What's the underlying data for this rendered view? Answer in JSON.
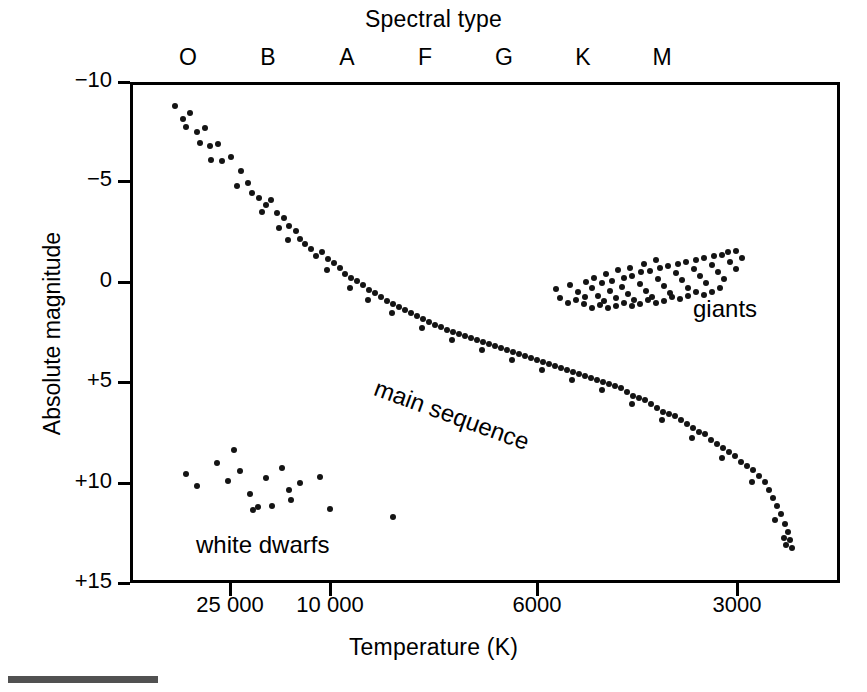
{
  "figure": {
    "top_title": "Spectral type",
    "bottom_title": "Temperature (K)",
    "y_axis_title": "Absolute magnitude"
  },
  "annotations": {
    "main_sequence": "main sequence",
    "giants": "giants",
    "white_dwarfs": "white dwarfs"
  },
  "chart_data": {
    "type": "scatter",
    "xlabel": "Temperature (K)",
    "ylabel": "Absolute magnitude",
    "secondary_xlabel": "Spectral type",
    "grid": false,
    "legend": "none",
    "x_axis": {
      "inverted": true,
      "scale": "log-like (temperature decreasing to the right)",
      "tick_values": [
        25000,
        10000,
        6000,
        3000
      ],
      "tick_labels": [
        "25 000",
        "10 000",
        "6000",
        "3000"
      ],
      "tick_px": [
        230,
        330,
        537,
        737
      ]
    },
    "spectral_axis": {
      "tick_labels": [
        "O",
        "B",
        "A",
        "F",
        "G",
        "K",
        "M"
      ],
      "tick_px": [
        188,
        268,
        347,
        425,
        504,
        583,
        662
      ]
    },
    "y_axis": {
      "inverted": true,
      "tick_values": [
        -10,
        -5,
        0,
        5,
        10,
        15
      ],
      "tick_labels": [
        "−10",
        "−5",
        "0",
        "+5",
        "+10",
        "+15"
      ],
      "tick_px": [
        82,
        181,
        282,
        382,
        483,
        583
      ],
      "ylim": [
        -10,
        15
      ]
    },
    "plot_box_px": {
      "left": 130,
      "top": 82,
      "right": 840,
      "bottom": 583
    },
    "series": [
      {
        "name": "main sequence",
        "point_count": 128,
        "points_px": [
          [
            175,
            106
          ],
          [
            183,
            119
          ],
          [
            190,
            113
          ],
          [
            197,
            132
          ],
          [
            186,
            127
          ],
          [
            205,
            128
          ],
          [
            200,
            143
          ],
          [
            210,
            146
          ],
          [
            218,
            144
          ],
          [
            211,
            160
          ],
          [
            222,
            161
          ],
          [
            231,
            157
          ],
          [
            241,
            171
          ],
          [
            237,
            186
          ],
          [
            248,
            183
          ],
          [
            252,
            193
          ],
          [
            259,
            198
          ],
          [
            266,
            205
          ],
          [
            271,
            200
          ],
          [
            262,
            212
          ],
          [
            277,
            213
          ],
          [
            284,
            218
          ],
          [
            279,
            228
          ],
          [
            289,
            226
          ],
          [
            296,
            231
          ],
          [
            288,
            240
          ],
          [
            300,
            239
          ],
          [
            305,
            244
          ],
          [
            311,
            249
          ],
          [
            316,
            256
          ],
          [
            322,
            252
          ],
          [
            328,
            259
          ],
          [
            334,
            263
          ],
          [
            327,
            270
          ],
          [
            340,
            268
          ],
          [
            345,
            274
          ],
          [
            351,
            278
          ],
          [
            357,
            281
          ],
          [
            350,
            288
          ],
          [
            363,
            285
          ],
          [
            369,
            290
          ],
          [
            375,
            293
          ],
          [
            368,
            300
          ],
          [
            381,
            297
          ],
          [
            387,
            301
          ],
          [
            393,
            304
          ],
          [
            399,
            307
          ],
          [
            392,
            313
          ],
          [
            405,
            310
          ],
          [
            411,
            313
          ],
          [
            417,
            316
          ],
          [
            423,
            319
          ],
          [
            429,
            322
          ],
          [
            422,
            328
          ],
          [
            435,
            325
          ],
          [
            441,
            327
          ],
          [
            447,
            330
          ],
          [
            453,
            332
          ],
          [
            459,
            334
          ],
          [
            452,
            340
          ],
          [
            465,
            336
          ],
          [
            471,
            338
          ],
          [
            477,
            340
          ],
          [
            483,
            342
          ],
          [
            489,
            344
          ],
          [
            482,
            350
          ],
          [
            495,
            346
          ],
          [
            501,
            348
          ],
          [
            507,
            350
          ],
          [
            513,
            352
          ],
          [
            519,
            354
          ],
          [
            512,
            360
          ],
          [
            525,
            356
          ],
          [
            531,
            358
          ],
          [
            537,
            360
          ],
          [
            543,
            362
          ],
          [
            549,
            364
          ],
          [
            542,
            370
          ],
          [
            555,
            366
          ],
          [
            561,
            368
          ],
          [
            567,
            370
          ],
          [
            573,
            372
          ],
          [
            579,
            374
          ],
          [
            572,
            380
          ],
          [
            585,
            376
          ],
          [
            591,
            378
          ],
          [
            597,
            380
          ],
          [
            603,
            382
          ],
          [
            609,
            384
          ],
          [
            602,
            390
          ],
          [
            615,
            386
          ],
          [
            621,
            388
          ],
          [
            627,
            392
          ],
          [
            633,
            396
          ],
          [
            639,
            398
          ],
          [
            632,
            404
          ],
          [
            645,
            400
          ],
          [
            651,
            404
          ],
          [
            657,
            408
          ],
          [
            663,
            412
          ],
          [
            669,
            414
          ],
          [
            662,
            420
          ],
          [
            675,
            416
          ],
          [
            681,
            420
          ],
          [
            687,
            424
          ],
          [
            693,
            428
          ],
          [
            699,
            432
          ],
          [
            692,
            438
          ],
          [
            705,
            434
          ],
          [
            711,
            440
          ],
          [
            717,
            444
          ],
          [
            723,
            448
          ],
          [
            729,
            452
          ],
          [
            722,
            458
          ],
          [
            735,
            456
          ],
          [
            741,
            462
          ],
          [
            747,
            466
          ],
          [
            753,
            470
          ],
          [
            759,
            476
          ],
          [
            752,
            482
          ],
          [
            765,
            482
          ],
          [
            769,
            490
          ],
          [
            773,
            498
          ],
          [
            777,
            506
          ],
          [
            781,
            514
          ],
          [
            775,
            520
          ],
          [
            785,
            524
          ],
          [
            788,
            532
          ],
          [
            790,
            540
          ],
          [
            786,
            545
          ],
          [
            792,
            548
          ],
          [
            784,
            538
          ]
        ]
      },
      {
        "name": "giants",
        "point_count": 74,
        "points_px": [
          [
            556,
            289
          ],
          [
            570,
            285
          ],
          [
            578,
            292
          ],
          [
            585,
            297
          ],
          [
            592,
            288
          ],
          [
            598,
            296
          ],
          [
            604,
            301
          ],
          [
            610,
            291
          ],
          [
            616,
            298
          ],
          [
            602,
            283
          ],
          [
            612,
            281
          ],
          [
            622,
            287
          ],
          [
            628,
            294
          ],
          [
            634,
            300
          ],
          [
            624,
            278
          ],
          [
            632,
            276
          ],
          [
            640,
            284
          ],
          [
            646,
            291
          ],
          [
            652,
            297
          ],
          [
            641,
            272
          ],
          [
            650,
            271
          ],
          [
            658,
            279
          ],
          [
            664,
            286
          ],
          [
            670,
            293
          ],
          [
            660,
            268
          ],
          [
            668,
            266
          ],
          [
            676,
            273
          ],
          [
            682,
            280
          ],
          [
            688,
            288
          ],
          [
            678,
            264
          ],
          [
            686,
            262
          ],
          [
            694,
            269
          ],
          [
            700,
            276
          ],
          [
            706,
            283
          ],
          [
            696,
            260
          ],
          [
            704,
            258
          ],
          [
            712,
            265
          ],
          [
            718,
            272
          ],
          [
            724,
            279
          ],
          [
            714,
            256
          ],
          [
            722,
            255
          ],
          [
            730,
            262
          ],
          [
            736,
            269
          ],
          [
            728,
            252
          ],
          [
            736,
            251
          ],
          [
            742,
            258
          ],
          [
            720,
            288
          ],
          [
            712,
            292
          ],
          [
            704,
            295
          ],
          [
            696,
            292
          ],
          [
            688,
            296
          ],
          [
            680,
            299
          ],
          [
            672,
            297
          ],
          [
            664,
            301
          ],
          [
            656,
            303
          ],
          [
            648,
            300
          ],
          [
            640,
            304
          ],
          [
            632,
            306
          ],
          [
            624,
            303
          ],
          [
            616,
            306
          ],
          [
            608,
            308
          ],
          [
            600,
            305
          ],
          [
            592,
            308
          ],
          [
            584,
            304
          ],
          [
            576,
            300
          ],
          [
            568,
            303
          ],
          [
            560,
            298
          ],
          [
            586,
            282
          ],
          [
            594,
            278
          ],
          [
            606,
            274
          ],
          [
            618,
            270
          ],
          [
            630,
            268
          ],
          [
            644,
            264
          ],
          [
            656,
            260
          ]
        ]
      },
      {
        "name": "white dwarfs",
        "point_count": 18,
        "points_px": [
          [
            186,
            474
          ],
          [
            197,
            486
          ],
          [
            217,
            463
          ],
          [
            228,
            481
          ],
          [
            234,
            450
          ],
          [
            240,
            471
          ],
          [
            250,
            494
          ],
          [
            253,
            510
          ],
          [
            258,
            507
          ],
          [
            266,
            478
          ],
          [
            272,
            506
          ],
          [
            282,
            468
          ],
          [
            289,
            490
          ],
          [
            291,
            500
          ],
          [
            300,
            483
          ],
          [
            320,
            477
          ],
          [
            330,
            509
          ],
          [
            393,
            517
          ]
        ]
      }
    ]
  }
}
